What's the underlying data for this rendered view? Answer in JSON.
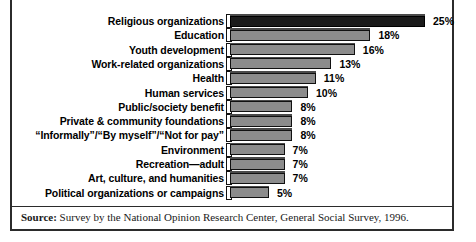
{
  "figure": {
    "source_label": "Source:",
    "source_text": " Survey by the National Opinion Research Center, General Social Survey, 1996."
  },
  "chart_data": {
    "type": "bar",
    "orientation": "horizontal",
    "title": "",
    "subtitle": "",
    "xlabel": "",
    "ylabel": "",
    "xlim": [
      0,
      25
    ],
    "grid": false,
    "legend": false,
    "value_suffix": "%",
    "colors": {
      "highlight_bar": "#1b1b1b",
      "bar": "#8c8c8c",
      "bar_outline": "#111111",
      "frame": "#2b2b2b",
      "background": "#ffffff",
      "text": "#000000"
    },
    "categories": [
      "Religious organizations",
      "Education",
      "Youth development",
      "Work-related organizations",
      "Health",
      "Human services",
      "Public/society benefit",
      "Private & community foundations",
      "“Informally”/“By myself”/“Not for pay”",
      "Environment",
      "Recreation—adult",
      "Art, culture, and humanities",
      "Political organizations or campaigns"
    ],
    "values": [
      25,
      18,
      16,
      13,
      11,
      10,
      8,
      8,
      8,
      7,
      7,
      7,
      5
    ],
    "value_labels": [
      "25%",
      "18%",
      "16%",
      "13%",
      "11%",
      "10%",
      "8%",
      "8%",
      "8%",
      "7%",
      "7%",
      "7%",
      "5%"
    ],
    "highlight_index": 0,
    "bars": [
      {
        "label": "Religious organizations",
        "value": 25,
        "value_label": "25%",
        "highlight": true
      },
      {
        "label": "Education",
        "value": 18,
        "value_label": "18%",
        "highlight": false
      },
      {
        "label": "Youth development",
        "value": 16,
        "value_label": "16%",
        "highlight": false
      },
      {
        "label": "Work-related organizations",
        "value": 13,
        "value_label": "13%",
        "highlight": false
      },
      {
        "label": "Health",
        "value": 11,
        "value_label": "11%",
        "highlight": false
      },
      {
        "label": "Human services",
        "value": 10,
        "value_label": "10%",
        "highlight": false
      },
      {
        "label": "Public/society benefit",
        "value": 8,
        "value_label": "8%",
        "highlight": false
      },
      {
        "label": "Private & community foundations",
        "value": 8,
        "value_label": "8%",
        "highlight": false
      },
      {
        "label": "“Informally”/“By myself”/“Not for pay”",
        "value": 8,
        "value_label": "8%",
        "highlight": false
      },
      {
        "label": "Environment",
        "value": 7,
        "value_label": "7%",
        "highlight": false
      },
      {
        "label": "Recreation—adult",
        "value": 7,
        "value_label": "7%",
        "highlight": false
      },
      {
        "label": "Art, culture, and humanities",
        "value": 7,
        "value_label": "7%",
        "highlight": false
      },
      {
        "label": "Political organizations or campaigns",
        "value": 5,
        "value_label": "5%",
        "highlight": false
      }
    ]
  }
}
